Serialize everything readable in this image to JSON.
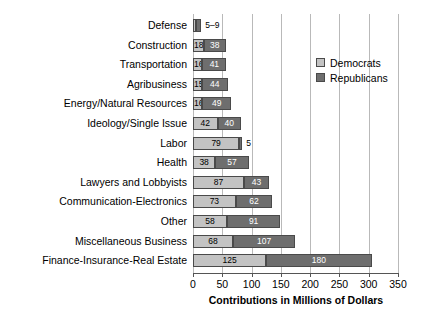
{
  "chart_data": {
    "type": "bar",
    "orientation": "horizontal",
    "stacked": true,
    "title": "",
    "xlabel": "Contributions in Millions of Dollars",
    "ylabel": "",
    "xlim": [
      0,
      350
    ],
    "xticks": [
      0,
      50,
      100,
      150,
      200,
      250,
      300,
      350
    ],
    "grid": "vertical",
    "legend_position": "upper right",
    "categories": [
      "Defense",
      "Construction",
      "Transportation",
      "Agribusiness",
      "Energy/Natural Resources",
      "Ideology/Single Issue",
      "Labor",
      "Health",
      "Lawyers and Lobbyists",
      "Communication-Electronics",
      "Other",
      "Miscellaneous Business",
      "Finance-Insurance-Real Estate"
    ],
    "series": [
      {
        "name": "Democrats",
        "color": "#c3c3c3",
        "values": [
          5,
          18,
          16,
          15,
          16,
          42,
          79,
          38,
          87,
          73,
          58,
          68,
          125
        ]
      },
      {
        "name": "Republicans",
        "color": "#6e6e6e",
        "values": [
          9,
          38,
          41,
          44,
          49,
          40,
          5,
          57,
          43,
          62,
          91,
          107,
          180
        ]
      }
    ],
    "bar_labels": [
      {
        "category": "Defense",
        "democrats": "",
        "republicans": "",
        "outside": "5–9"
      },
      {
        "category": "Construction",
        "democrats": "18",
        "republicans": "38",
        "outside": ""
      },
      {
        "category": "Transportation",
        "democrats": "16",
        "republicans": "41",
        "outside": ""
      },
      {
        "category": "Agribusiness",
        "democrats": "15",
        "republicans": "44",
        "outside": ""
      },
      {
        "category": "Energy/Natural Resources",
        "democrats": "16",
        "republicans": "49",
        "outside": ""
      },
      {
        "category": "Ideology/Single Issue",
        "democrats": "42",
        "republicans": "40",
        "outside": ""
      },
      {
        "category": "Labor",
        "democrats": "79",
        "republicans": "",
        "outside": "5"
      },
      {
        "category": "Health",
        "democrats": "38",
        "republicans": "57",
        "outside": ""
      },
      {
        "category": "Lawyers and Lobbyists",
        "democrats": "87",
        "republicans": "43",
        "outside": ""
      },
      {
        "category": "Communication-Electronics",
        "democrats": "73",
        "republicans": "62",
        "outside": ""
      },
      {
        "category": "Other",
        "democrats": "58",
        "republicans": "91",
        "outside": ""
      },
      {
        "category": "Miscellaneous Business",
        "democrats": "68",
        "republicans": "107",
        "outside": ""
      },
      {
        "category": "Finance-Insurance-Real Estate",
        "democrats": "125",
        "republicans": "180",
        "outside": ""
      }
    ]
  },
  "legend": {
    "items": [
      {
        "label": "Democrats",
        "color": "#c3c3c3"
      },
      {
        "label": "Republicans",
        "color": "#6e6e6e"
      }
    ]
  },
  "axis": {
    "x_title": "Contributions in Millions of Dollars",
    "x_tick_labels": [
      "0",
      "50",
      "100",
      "150",
      "200",
      "250",
      "300",
      "350"
    ]
  }
}
